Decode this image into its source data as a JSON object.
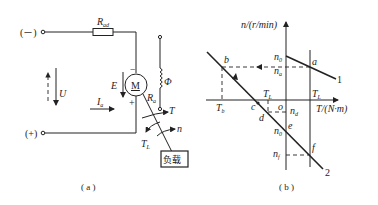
{
  "panel_a": {
    "caption": "( a )",
    "terminal_neg": "(－)",
    "terminal_pos": "(+)",
    "resistor": {
      "label": "R",
      "sub": "ad"
    },
    "motor_label": "M",
    "emf": {
      "label": "E",
      "minus": "−",
      "plus": "+"
    },
    "voltage": {
      "label": "U"
    },
    "current": {
      "label": "I",
      "sub": "a"
    },
    "armature_res": {
      "label": "R",
      "sub": "a"
    },
    "field": {
      "label": "Φ"
    },
    "torque": {
      "label": "T"
    },
    "load_torque": {
      "label": "T",
      "sub": "L"
    },
    "speed": {
      "label": "n"
    },
    "load_box": "负载"
  },
  "panel_b": {
    "caption": "( b )",
    "y_axis": "n/(r/min)",
    "x_axis": "T/(N·m)",
    "origin": "o",
    "points": {
      "a": "a",
      "b": "b",
      "c": "c",
      "d": "d",
      "e": "e",
      "f": "f"
    },
    "labels": {
      "n0_top": {
        "label": "n",
        "sub": "0"
      },
      "na": {
        "label": "n",
        "sub": "a"
      },
      "nd": {
        "label": "n",
        "sub": "d"
      },
      "n0_bot": {
        "label": "n",
        "sub": "0"
      },
      "nf": {
        "label": "n",
        "sub": "f"
      },
      "Tb": {
        "label": "T",
        "sub": "b"
      },
      "TL_left": {
        "label": "T",
        "sub": "L"
      },
      "TL_right": {
        "label": "T",
        "sub": "L"
      }
    },
    "curve_labels": {
      "line1": "1",
      "line2": "2"
    }
  }
}
